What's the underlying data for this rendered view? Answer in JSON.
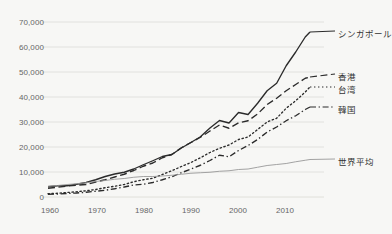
{
  "chart_data": {
    "type": "line",
    "title": "",
    "subtitle": "",
    "xlabel": "",
    "ylabel": "",
    "xlim": [
      1960,
      2015
    ],
    "ylim": [
      0,
      70000
    ],
    "grid": true,
    "legend_position": "inline-right",
    "x_ticks": [
      "1960",
      "1970",
      "1980",
      "1990",
      "2000",
      "2010"
    ],
    "x_tick_values": [
      1960,
      1970,
      1980,
      1990,
      2000,
      2010
    ],
    "y_ticks": [
      "0",
      "10,000",
      "20,000",
      "30,000",
      "40,000",
      "50,000",
      "60,000",
      "70,000"
    ],
    "y_tick_values": [
      0,
      10000,
      20000,
      30000,
      40000,
      50000,
      60000,
      70000
    ],
    "x": [
      1960,
      1962,
      1964,
      1966,
      1968,
      1970,
      1972,
      1974,
      1976,
      1978,
      1980,
      1982,
      1984,
      1986,
      1988,
      1990,
      1992,
      1994,
      1996,
      1998,
      2000,
      2002,
      2004,
      2006,
      2008,
      2010,
      2012,
      2014,
      2015
    ],
    "series": [
      {
        "name": "シンガポール",
        "style": "solid",
        "color": "#2b2b2b",
        "end_value": 66000,
        "values": [
          4100,
          4500,
          4500,
          5100,
          5800,
          6900,
          8200,
          9200,
          9900,
          11200,
          12900,
          14500,
          16200,
          17000,
          19600,
          21800,
          24100,
          27600,
          30600,
          29600,
          33800,
          33000,
          37500,
          42500,
          45500,
          52500,
          58000,
          64000,
          66000
        ]
      },
      {
        "name": "香港",
        "style": "dashed",
        "color": "#2b2b2b",
        "end_value": 48000,
        "values": [
          3500,
          3900,
          4400,
          4700,
          5000,
          6000,
          6900,
          8000,
          9100,
          10600,
          12300,
          13600,
          15700,
          17000,
          19700,
          21800,
          23900,
          26400,
          28800,
          27500,
          29700,
          30500,
          33200,
          37000,
          39500,
          42500,
          45000,
          47500,
          48000
        ]
      },
      {
        "name": "台湾",
        "style": "dotted",
        "color": "#2b2b2b",
        "end_value": 44000,
        "values": [
          1300,
          1500,
          1800,
          2100,
          2500,
          3000,
          3700,
          4300,
          5000,
          6100,
          6900,
          7500,
          9000,
          10500,
          12200,
          13800,
          15700,
          17800,
          19500,
          20800,
          23000,
          24000,
          27000,
          30000,
          31500,
          35500,
          38500,
          42000,
          44000
        ]
      },
      {
        "name": "韓国",
        "style": "dashdot",
        "color": "#2b2b2b",
        "end_value": 36000,
        "values": [
          1100,
          1200,
          1400,
          1600,
          1900,
          2300,
          2700,
          3300,
          4000,
          4800,
          5100,
          5800,
          6900,
          8100,
          9700,
          11200,
          12700,
          14600,
          16700,
          16100,
          18600,
          20600,
          23000,
          26000,
          28000,
          30500,
          32500,
          35000,
          36000
        ]
      },
      {
        "name": "世界平均",
        "style": "solid-thin",
        "color": "#999999",
        "end_value": 15000,
        "values": [
          4300,
          4600,
          5000,
          5300,
          5700,
          6200,
          6600,
          7100,
          7400,
          7900,
          8200,
          8200,
          8400,
          8700,
          9100,
          9500,
          9700,
          9900,
          10300,
          10500,
          11000,
          11200,
          11900,
          12600,
          13000,
          13400,
          14100,
          14700,
          15000
        ]
      }
    ]
  },
  "axis": {
    "y_label_0": "0",
    "y_label_1": "10,000",
    "y_label_2": "20,000",
    "y_label_3": "30,000",
    "y_label_4": "40,000",
    "y_label_5": "50,000",
    "y_label_6": "60,000",
    "y_label_7": "70,000",
    "x_label_0": "1960",
    "x_label_1": "1970",
    "x_label_2": "1980",
    "x_label_3": "1990",
    "x_label_4": "2000",
    "x_label_5": "2010"
  },
  "labels": {
    "singapore": "シンガポール",
    "hongkong": "香港",
    "taiwan": "台湾",
    "korea": "韓国",
    "world": "世界平均"
  },
  "colors": {
    "background": "#f7f7f5",
    "grid": "#dcdcd8",
    "line_dark": "#2b2b2b",
    "line_world": "#999999",
    "tick_text": "#666666",
    "label_text": "#333333"
  }
}
